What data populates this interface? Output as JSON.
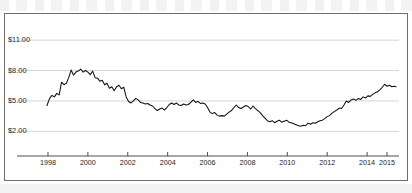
{
  "chart_data": {
    "type": "line",
    "title": "",
    "subtitle": "",
    "xlabel": "",
    "ylabel": "",
    "xlim": [
      1997.85,
      2015.6
    ],
    "ylim": [
      0.55,
      12.4
    ],
    "grid": true,
    "legend_position": "none",
    "y_ticks": [
      2,
      5,
      8,
      11
    ],
    "y_tick_labels": [
      "$2.00",
      "$5.00",
      "$8.00",
      "$11.00"
    ],
    "x_ticks": [
      1998,
      2000,
      2002,
      2004,
      2006,
      2008,
      2010,
      2012,
      2014,
      2015
    ],
    "x_tick_labels": [
      "1998",
      "2000",
      "2002",
      "2004",
      "2006",
      "2008",
      "2010",
      "2012",
      "2014",
      "2015"
    ],
    "series": [
      {
        "name": "Price",
        "color": "#111111",
        "x": [
          1997.95,
          1998.08,
          1998.2,
          1998.32,
          1998.44,
          1998.56,
          1998.68,
          1998.8,
          1998.92,
          1999.04,
          1999.16,
          1999.28,
          1999.4,
          1999.52,
          1999.64,
          1999.76,
          1999.88,
          2000.0,
          2000.12,
          2000.24,
          2000.36,
          2000.48,
          2000.6,
          2000.72,
          2000.84,
          2000.96,
          2001.08,
          2001.2,
          2001.32,
          2001.44,
          2001.56,
          2001.68,
          2001.8,
          2001.92,
          2002.04,
          2002.16,
          2002.28,
          2002.4,
          2002.52,
          2002.64,
          2002.76,
          2002.88,
          2003.0,
          2003.12,
          2003.24,
          2003.36,
          2003.48,
          2003.6,
          2003.72,
          2003.84,
          2003.96,
          2004.08,
          2004.2,
          2004.32,
          2004.44,
          2004.56,
          2004.68,
          2004.8,
          2004.92,
          2005.04,
          2005.16,
          2005.28,
          2005.4,
          2005.52,
          2005.64,
          2005.76,
          2005.88,
          2006.0,
          2006.12,
          2006.24,
          2006.36,
          2006.48,
          2006.6,
          2006.72,
          2006.84,
          2006.96,
          2007.08,
          2007.2,
          2007.32,
          2007.44,
          2007.56,
          2007.68,
          2007.8,
          2007.92,
          2008.04,
          2008.16,
          2008.28,
          2008.4,
          2008.52,
          2008.64,
          2008.76,
          2008.88,
          2009.0,
          2009.12,
          2009.24,
          2009.36,
          2009.48,
          2009.6,
          2009.72,
          2009.84,
          2009.96,
          2010.08,
          2010.2,
          2010.32,
          2010.44,
          2010.56,
          2010.68,
          2010.8,
          2010.92,
          2011.04,
          2011.16,
          2011.28,
          2011.4,
          2011.52,
          2011.64,
          2011.76,
          2011.88,
          2012.0,
          2012.12,
          2012.24,
          2012.36,
          2012.48,
          2012.6,
          2012.72,
          2012.84,
          2012.96,
          2013.08,
          2013.2,
          2013.32,
          2013.44,
          2013.56,
          2013.68,
          2013.8,
          2013.92,
          2014.04,
          2014.16,
          2014.28,
          2014.4,
          2014.52,
          2014.64,
          2014.76,
          2014.88,
          2015.0,
          2015.12,
          2015.24,
          2015.36,
          2015.45
        ],
        "y": [
          4.55,
          5.25,
          5.55,
          5.4,
          5.75,
          5.6,
          6.85,
          6.6,
          6.75,
          7.3,
          8.05,
          7.55,
          7.85,
          7.95,
          8.15,
          7.85,
          8.0,
          7.85,
          7.6,
          7.95,
          7.3,
          7.25,
          6.95,
          7.05,
          6.6,
          6.75,
          6.25,
          6.4,
          6.0,
          6.4,
          6.55,
          6.2,
          6.35,
          5.4,
          4.95,
          4.8,
          5.0,
          5.25,
          5.1,
          4.85,
          4.8,
          4.7,
          4.75,
          4.6,
          4.5,
          4.25,
          4.05,
          4.2,
          4.3,
          4.1,
          4.35,
          4.65,
          4.8,
          4.65,
          4.8,
          4.6,
          4.55,
          4.7,
          4.6,
          4.65,
          4.85,
          5.1,
          4.85,
          4.95,
          4.75,
          4.8,
          4.7,
          4.35,
          3.9,
          3.75,
          3.85,
          3.6,
          3.5,
          3.55,
          3.5,
          3.7,
          3.9,
          4.05,
          4.35,
          4.6,
          4.35,
          4.25,
          4.4,
          4.55,
          4.45,
          4.2,
          4.5,
          4.25,
          4.05,
          3.85,
          3.55,
          3.3,
          3.05,
          2.95,
          3.05,
          2.85,
          3.0,
          3.1,
          2.9,
          3.0,
          3.1,
          2.9,
          2.85,
          2.75,
          2.65,
          2.55,
          2.5,
          2.6,
          2.55,
          2.8,
          2.7,
          2.85,
          2.8,
          2.95,
          3.05,
          3.1,
          3.25,
          3.45,
          3.55,
          3.8,
          3.95,
          4.1,
          4.3,
          4.25,
          4.6,
          5.0,
          4.85,
          5.1,
          5.2,
          5.05,
          5.25,
          5.15,
          5.4,
          5.3,
          5.5,
          5.45,
          5.65,
          5.8,
          5.9,
          6.1,
          6.35,
          6.65,
          6.45,
          6.55,
          6.4,
          6.45,
          6.4
        ]
      }
    ]
  }
}
